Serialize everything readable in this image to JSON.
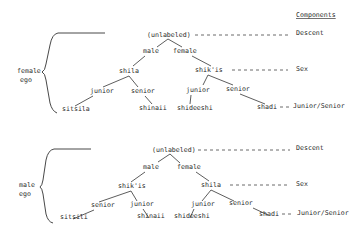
{
  "components": {
    "heading": "Components",
    "levels": [
      "Descent",
      "Sex",
      "Junior/Senior"
    ]
  },
  "diagrams": [
    {
      "ego_label": [
        "female",
        "ego"
      ],
      "root": "(unlabeled)",
      "sex_nodes": [
        "male",
        "female"
      ],
      "sibling_nodes": [
        "shila",
        "shik'is"
      ],
      "age_nodes": [
        "junior",
        "senior",
        "junior",
        "senior"
      ],
      "terms": [
        "sitsila",
        "shinaii",
        "shideeshi",
        "shadi"
      ]
    },
    {
      "ego_label": [
        "male",
        "ego"
      ],
      "root": "(unlabeled)",
      "sex_nodes": [
        "male",
        "female"
      ],
      "sibling_nodes": [
        "shik'is",
        "shila"
      ],
      "age_nodes": [
        "senior",
        "junior",
        "junior",
        "senior"
      ],
      "terms": [
        "sitsili",
        "shinaii",
        "shideeshi",
        "shadi"
      ]
    }
  ]
}
